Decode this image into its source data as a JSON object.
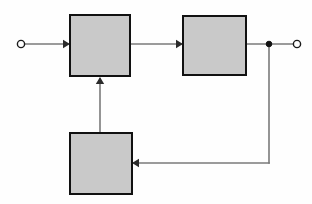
{
  "canvas": {
    "width": 312,
    "height": 204,
    "background_color": "#fefefe",
    "title": "Block Diagram"
  },
  "style": {
    "block_fill": "#c9c9c9",
    "block_border": "#111111",
    "wire_color": "#7a7a7a",
    "arrow_color": "#2b2b2b",
    "terminal_fill": "#ffffff",
    "terminal_stroke": "#1a1a1a",
    "junction_fill": "#111111"
  },
  "blocks": [
    {
      "id": "block-forward-1",
      "label": "",
      "x": 70,
      "y": 15,
      "width": 60,
      "height": 61
    },
    {
      "id": "block-forward-2",
      "label": "",
      "x": 183,
      "y": 16,
      "width": 63,
      "height": 59
    },
    {
      "id": "block-feedback",
      "label": "",
      "x": 70,
      "y": 133,
      "width": 62,
      "height": 61
    }
  ],
  "terminals": [
    {
      "id": "input-terminal",
      "type": "open-circle",
      "cx": 21,
      "cy": 44,
      "r": 3.6,
      "label": ""
    },
    {
      "id": "output-terminal",
      "type": "open-circle",
      "cx": 297,
      "cy": 44,
      "r": 3.6,
      "label": ""
    }
  ],
  "junctions": [
    {
      "id": "output-tap-junction",
      "cx": 269,
      "cy": 44,
      "r": 2.8
    }
  ],
  "wires": [
    {
      "id": "wire-input-to-block1",
      "path": "M 25 44 L 68 44",
      "arrow": {
        "x": 70,
        "y": 44,
        "dir": "right"
      }
    },
    {
      "id": "wire-block1-to-block2",
      "path": "M 130 44 L 181 44",
      "arrow": {
        "x": 183,
        "y": 44,
        "dir": "right"
      }
    },
    {
      "id": "wire-block2-to-output",
      "path": "M 246 44 L 294 44",
      "arrow": null
    },
    {
      "id": "wire-junction-down",
      "path": "M 269 44 L 269 163",
      "arrow": null
    },
    {
      "id": "wire-feedback-horizontal",
      "path": "M 269 163 L 134 163",
      "arrow": {
        "x": 132,
        "y": 163,
        "dir": "left"
      }
    },
    {
      "id": "wire-feedback-up-to-block1",
      "path": "M 100 133 L 100 79",
      "arrow": {
        "x": 100,
        "y": 77,
        "dir": "up"
      }
    }
  ]
}
